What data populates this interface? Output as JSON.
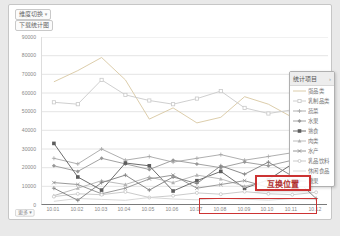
{
  "toolbar": {
    "dimension_switch": "维度切换",
    "dropdown_arrow": "▾",
    "download": "下载统计图"
  },
  "legend": {
    "header": "统计项目",
    "arrow": "›"
  },
  "annotation": {
    "swap_position": "互换位置",
    "highlight_range": [
      "10.08",
      "10.12"
    ],
    "color": "#cc3333"
  },
  "footer": {
    "more": "更多",
    "arrow": "▾"
  },
  "colors": {
    "grid": "#e4e4e4",
    "axis": "#7a7a7a",
    "tick_text": "#888888"
  },
  "chart_data": {
    "type": "line",
    "title": "",
    "xlabel": "",
    "ylabel": "",
    "ylim": [
      0,
      90000
    ],
    "ytick_step": 10000,
    "grid": true,
    "legend_position": "right-overlay",
    "x": [
      "10.01",
      "10.02",
      "10.03",
      "10.04",
      "10.05",
      "10.06",
      "10.07",
      "10.08",
      "10.09",
      "10.10",
      "10.11",
      "10.12"
    ],
    "series": [
      {
        "name": "蛋品类",
        "color": "#d8c7a2",
        "marker": "none",
        "values": [
          66000,
          72000,
          79000,
          67000,
          46000,
          52000,
          44000,
          47000,
          58000,
          54000,
          47000,
          69000
        ]
      },
      {
        "name": "乳制品类",
        "color": "#c9c9c9",
        "marker": "square",
        "values": [
          55000,
          54000,
          67000,
          59000,
          56000,
          54000,
          57000,
          61000,
          52000,
          49000,
          51000,
          64000
        ]
      },
      {
        "name": "蔬菜",
        "color": "#a6a6a6",
        "marker": "plus",
        "values": [
          25000,
          22000,
          30000,
          24000,
          26000,
          23000,
          25000,
          27000,
          24000,
          26000,
          28000,
          25000
        ]
      },
      {
        "name": "水果",
        "color": "#979797",
        "marker": "diamond",
        "values": [
          21000,
          18000,
          25000,
          22000,
          19000,
          24000,
          22000,
          20000,
          23000,
          21000,
          24000,
          22000
        ]
      },
      {
        "name": "熟食",
        "color": "#5c5c5c",
        "marker": "square-filled",
        "values": [
          33000,
          15000,
          8000,
          22500,
          21000,
          7500,
          13000,
          18000,
          9000,
          13500,
          22000,
          21500
        ]
      },
      {
        "name": "肉类",
        "color": "#b3b3b3",
        "marker": "triangle",
        "values": [
          5000,
          9000,
          13000,
          11000,
          15000,
          12000,
          16000,
          14000,
          10000,
          13000,
          15000,
          14000
        ]
      },
      {
        "name": "水产",
        "color": "#8d8d8d",
        "marker": "x",
        "values": [
          12000,
          11000,
          6000,
          9000,
          14000,
          16000,
          9000,
          11000,
          13000,
          9500,
          12500,
          11000
        ]
      },
      {
        "name": "乳品饮料",
        "color": "#c5c5c5",
        "marker": "circle",
        "values": [
          4500,
          6000,
          5500,
          7000,
          4000,
          5000,
          6500,
          5800,
          7200,
          6000,
          5500,
          6800
        ]
      },
      {
        "name": "休闲食品",
        "color": "#d2d2d2",
        "marker": "none",
        "values": [
          2000,
          3500,
          3000,
          2500,
          4000,
          3200,
          2800,
          3600,
          3100,
          2600,
          3400,
          3000
        ]
      },
      {
        "name": "糖果",
        "color": "#7d7d7d",
        "marker": "plus",
        "values": [
          9000,
          2500,
          12000,
          16000,
          8000,
          15000,
          11500,
          21000,
          16500,
          23000,
          15500,
          3500
        ]
      }
    ]
  }
}
